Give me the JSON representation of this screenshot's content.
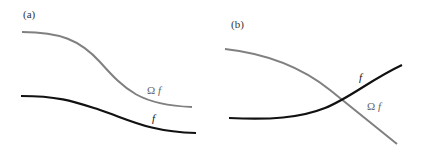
{
  "figure": {
    "panels": [
      {
        "label": "(a)",
        "curves": [
          {
            "name": "Omega f",
            "label_prefix": "Ω",
            "label_var": "f",
            "color": "#808080"
          },
          {
            "name": "f",
            "label_prefix": "",
            "label_var": "f",
            "color": "#111111"
          }
        ]
      },
      {
        "label": "(b)",
        "curves": [
          {
            "name": "f",
            "label_prefix": "",
            "label_var": "f",
            "color": "#111111"
          },
          {
            "name": "Omega f",
            "label_prefix": "Ω",
            "label_var": "f",
            "color": "#808080"
          }
        ]
      }
    ]
  }
}
